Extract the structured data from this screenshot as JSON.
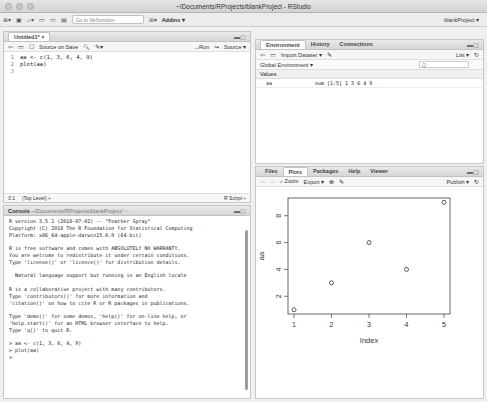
{
  "window": {
    "title": "~/Documents/RProjects/blankProject - RStudio"
  },
  "toolbar": {
    "goto_placeholder": "Go to file/function",
    "addins_label": "Addins ▾",
    "project_label": "blankProject ▾"
  },
  "editor": {
    "tab_label": "Untitled1* ×",
    "source_on_save_label": "Source on Save",
    "run_label": "→Run",
    "source_label": "Source ▾",
    "lines": [
      {
        "num": "1",
        "text": "aa <- c(1, 3, 6, 4, 9)"
      },
      {
        "num": "2",
        "text": "plot(aa)"
      },
      {
        "num": "3",
        "text": ""
      }
    ],
    "status_position": "3:1",
    "status_scope": "(Top Level) ÷",
    "status_type": "R Script ÷"
  },
  "console": {
    "tab_label": "Console",
    "path": "~/Documents/RProjects/blankProject/",
    "output": "R version 3.5.1 (2018-07-02) -- \"Feather Spray\"\nCopyright (C) 2018 The R Foundation for Statistical Computing\nPlatform: x86_64-apple-darwin15.6.0 (64-bit)\n\nR is free software and comes with ABSOLUTELY NO WARRANTY.\nYou are welcome to redistribute it under certain conditions.\nType 'license()' or 'licence()' for distribution details.\n\n  Natural language support but running in an English locale\n\nR is a collaborative project with many contributors.\nType 'contributors()' for more information and\n'citation()' on how to cite R or R packages in publications.\n\nType 'demo()' for some demos, 'help()' for on-line help, or\n'help.start()' for an HTML browser interface to help.\nType 'q()' to quit R.\n\n> aa <- c(1, 3, 6, 4, 9)\n> plot(aa)\n> "
  },
  "environment": {
    "tabs": [
      "Environment",
      "History",
      "Connections"
    ],
    "import_label": "Import Dataset ▾",
    "list_label": "List ▾",
    "scope_label": "Global Environment ▾",
    "search_placeholder": "Q",
    "section": "Values",
    "rows": [
      {
        "name": "aa",
        "value": "num [1:5] 1 3 6 4 9"
      }
    ]
  },
  "viewer": {
    "tabs": [
      "Files",
      "Plots",
      "Packages",
      "Help",
      "Viewer"
    ],
    "zoom_label": "Zoom",
    "export_label": "Export ▾",
    "publish_label": "Publish ▾"
  },
  "chart_data": {
    "type": "scatter",
    "title": "",
    "xlabel": "Index",
    "ylabel": "aa",
    "x": [
      1,
      2,
      3,
      4,
      5
    ],
    "values": [
      1,
      3,
      6,
      4,
      9
    ],
    "xticks": [
      "1",
      "2",
      "3",
      "4",
      "5"
    ],
    "yticks": [
      "2",
      "4",
      "6",
      "8"
    ],
    "xlim": [
      0.84,
      5.16
    ],
    "ylim": [
      0.68,
      9.32
    ],
    "grid": false,
    "marker": "open-circle"
  }
}
